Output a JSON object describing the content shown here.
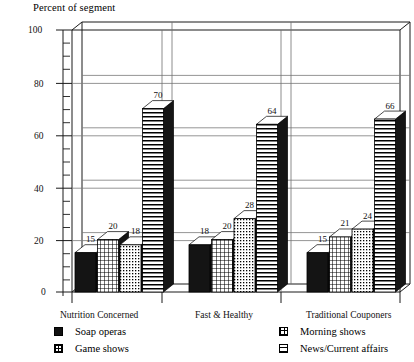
{
  "chart_data": {
    "type": "bar",
    "title": "Percent of segment",
    "xlabel": "",
    "ylabel": "Percent of segment",
    "ylim": [
      0,
      100
    ],
    "ytick_values": [
      0,
      20,
      40,
      60,
      80,
      100
    ],
    "ytick_labels": [
      "0",
      "20",
      "40",
      "60",
      "80",
      "100"
    ],
    "grid": true,
    "grid_axis": "y",
    "legend_position": "bottom",
    "style": "3d-bar",
    "categories": [
      "Nutrition Concerned",
      "Fast & Healthy",
      "Traditional Couponers"
    ],
    "series": [
      {
        "name": "Soap operas",
        "pattern": "solid",
        "values": [
          15,
          18,
          15
        ]
      },
      {
        "name": "Game shows",
        "pattern": "crosshatch",
        "values": [
          20,
          20,
          21
        ]
      },
      {
        "name": "Morning shows",
        "pattern": "dotted",
        "values": [
          18,
          28,
          24
        ]
      },
      {
        "name": "News/Current affairs",
        "pattern": "horizontal",
        "values": [
          70,
          64,
          66
        ]
      }
    ],
    "data_labels": [
      [
        "15",
        "20",
        "18",
        "70"
      ],
      [
        "18",
        "20",
        "28",
        "64"
      ],
      [
        "15",
        "21",
        "24",
        "66"
      ]
    ]
  },
  "legend": {
    "left_column": [
      {
        "label": "Soap operas",
        "swatch": "sw-solid",
        "icon": "solid-square-swatch"
      },
      {
        "label": "Game shows",
        "swatch": "sw-cross",
        "icon": "crosshatch-square-swatch"
      }
    ],
    "right_column": [
      {
        "label": "Morning shows",
        "swatch": "sw-dot",
        "icon": "dotted-square-swatch"
      },
      {
        "label": "News/Current affairs",
        "swatch": "sw-hline",
        "icon": "horizontal-lines-square-swatch"
      }
    ]
  }
}
